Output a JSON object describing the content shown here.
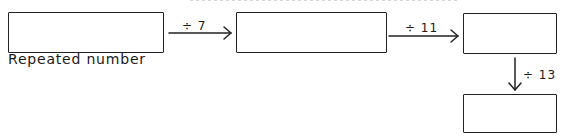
{
  "diagram": {
    "boxes": [
      {
        "id": "start",
        "label": "Repeated number",
        "value": ""
      },
      {
        "id": "after-7",
        "label": "",
        "value": ""
      },
      {
        "id": "after-11",
        "label": "",
        "value": ""
      },
      {
        "id": "after-13",
        "label": "",
        "value": ""
      }
    ],
    "operations": [
      {
        "from": "start",
        "to": "after-7",
        "label": "÷ 7"
      },
      {
        "from": "after-7",
        "to": "after-11",
        "label": "÷ 11"
      },
      {
        "from": "after-11",
        "to": "after-13",
        "label": "÷ 13"
      }
    ]
  }
}
